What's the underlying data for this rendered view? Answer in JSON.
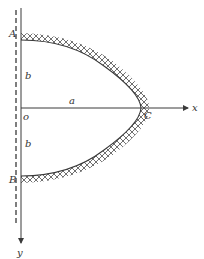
{
  "diagram": {
    "type": "semi-elliptical hatched boundary on coordinate axes",
    "colors": {
      "line": "#3a3a3a",
      "hatch": "#4a4a4a",
      "background": "#ffffff"
    },
    "axes": {
      "x_label": "x",
      "y_label": "y",
      "origin_label": "o"
    },
    "points": {
      "top": "A",
      "bottom": "B",
      "apex": "C"
    },
    "dimensions": {
      "horizontal": "a",
      "upper_vertical": "b",
      "lower_vertical": "b"
    }
  }
}
